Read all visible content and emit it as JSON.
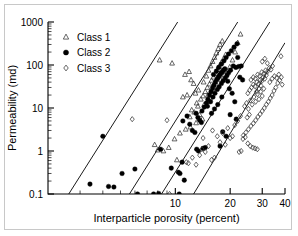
{
  "chart_data": {
    "type": "scatter",
    "title": "",
    "xlabel": "Interparticle porosity (percent)",
    "ylabel": "Permeability (md)",
    "xscale": "log",
    "yscale": "log",
    "xlim": [
      2,
      40
    ],
    "ylim": [
      0.1,
      1000
    ],
    "xticks": [
      10,
      20,
      30,
      40
    ],
    "xticklabels": [
      "10",
      "20",
      "30",
      "40"
    ],
    "yticks": [
      0.1,
      1,
      10,
      100,
      1000
    ],
    "yticklabels": [
      "0.1",
      "1",
      "10",
      "100",
      "1000"
    ],
    "grid": false,
    "legend_position": "upper-left",
    "legend": [
      {
        "label": "Class 1",
        "marker": "open-triangle",
        "color": "#333333"
      },
      {
        "label": "Class 2",
        "marker": "filled-circle",
        "color": "#000000"
      },
      {
        "label": "Class 3",
        "marker": "open-diamond",
        "color": "#333333"
      }
    ],
    "series": [
      {
        "name": "Class 1",
        "marker": "open-triangle",
        "points": [
          [
            8.2,
            130
          ],
          [
            9.6,
            110
          ],
          [
            11.3,
            60
          ],
          [
            11.9,
            70
          ],
          [
            12.2,
            45
          ],
          [
            12.6,
            37
          ],
          [
            11.0,
            18
          ],
          [
            11.6,
            20
          ],
          [
            12.9,
            22
          ],
          [
            13.4,
            26
          ],
          [
            13.1,
            13
          ],
          [
            12.3,
            9.0
          ],
          [
            13.6,
            7.0
          ],
          [
            14.1,
            5.5
          ],
          [
            13.0,
            4.5
          ],
          [
            12.1,
            3.6
          ],
          [
            11.4,
            3.2
          ],
          [
            10.6,
            2.6
          ],
          [
            9.9,
            1.9
          ],
          [
            9.2,
            1.2
          ],
          [
            8.6,
            1.0
          ],
          [
            8.0,
            1.05
          ],
          [
            7.7,
            1.4
          ],
          [
            10.2,
            0.62
          ],
          [
            14.3,
            40
          ],
          [
            14.8,
            55
          ],
          [
            15.2,
            75
          ],
          [
            15.6,
            95
          ],
          [
            16.0,
            120
          ],
          [
            16.4,
            150
          ],
          [
            16.8,
            190
          ],
          [
            17.2,
            240
          ],
          [
            17.6,
            300
          ],
          [
            18.1,
            360
          ],
          [
            15.0,
            30
          ],
          [
            15.4,
            36
          ],
          [
            15.8,
            44
          ],
          [
            16.2,
            52
          ],
          [
            16.6,
            62
          ],
          [
            17.0,
            78
          ],
          [
            17.4,
            92
          ],
          [
            17.9,
            115
          ],
          [
            18.4,
            140
          ],
          [
            18.9,
            175
          ],
          [
            14.6,
            24
          ],
          [
            15.1,
            20
          ],
          [
            15.5,
            17
          ],
          [
            14.9,
            14
          ],
          [
            14.4,
            12
          ],
          [
            16.1,
            28
          ],
          [
            16.9,
            34
          ],
          [
            17.8,
            46
          ],
          [
            18.6,
            58
          ],
          [
            19.3,
            70
          ],
          [
            19.9,
            90
          ],
          [
            20.6,
            130
          ],
          [
            21.3,
            200
          ],
          [
            22.0,
            330
          ],
          [
            22.8,
            520
          ],
          [
            13.8,
            16
          ],
          [
            14.2,
            19
          ],
          [
            13.3,
            11
          ],
          [
            12.7,
            8.0
          ],
          [
            12.0,
            6.2
          ]
        ]
      },
      {
        "name": "Class 2",
        "marker": "filled-circle",
        "points": [
          [
            3.4,
            0.17
          ],
          [
            4.3,
            0.15
          ],
          [
            4.6,
            0.145
          ],
          [
            4.0,
            2.2
          ],
          [
            5.1,
            0.3
          ],
          [
            6.0,
            0.38
          ],
          [
            6.2,
            0.1
          ],
          [
            7.6,
            0.1
          ],
          [
            8.1,
            0.103
          ],
          [
            8.3,
            1.1
          ],
          [
            9.5,
            0.4
          ],
          [
            10.4,
            0.32
          ],
          [
            10.6,
            0.3
          ],
          [
            10.5,
            0.1
          ],
          [
            11.2,
            0.21
          ],
          [
            10.9,
            0.55
          ],
          [
            11.0,
            5.0
          ],
          [
            11.6,
            6.5
          ],
          [
            12.0,
            4.2
          ],
          [
            12.4,
            3.0
          ],
          [
            12.8,
            2.7
          ],
          [
            13.0,
            7.5
          ],
          [
            13.3,
            6.0
          ],
          [
            13.6,
            5.2
          ],
          [
            13.9,
            4.6
          ],
          [
            13.1,
            1.1
          ],
          [
            13.4,
            1.0
          ],
          [
            14.2,
            1.15
          ],
          [
            14.6,
            1.2
          ],
          [
            14.0,
            8.5
          ],
          [
            14.4,
            10.5
          ],
          [
            14.8,
            13
          ],
          [
            15.1,
            16
          ],
          [
            15.4,
            20
          ],
          [
            15.7,
            24
          ],
          [
            16.0,
            29
          ],
          [
            16.3,
            34
          ],
          [
            16.6,
            40
          ],
          [
            16.9,
            46
          ],
          [
            17.2,
            52
          ],
          [
            17.5,
            58
          ],
          [
            17.8,
            64
          ],
          [
            18.1,
            70
          ],
          [
            18.4,
            76
          ],
          [
            18.7,
            82
          ],
          [
            15.0,
            11
          ],
          [
            15.6,
            14
          ],
          [
            16.1,
            18
          ],
          [
            16.5,
            22
          ],
          [
            17.0,
            27
          ],
          [
            17.4,
            31
          ],
          [
            17.9,
            37
          ],
          [
            18.3,
            43
          ],
          [
            18.8,
            50
          ],
          [
            19.2,
            57
          ],
          [
            19.6,
            66
          ],
          [
            20.1,
            76
          ],
          [
            16.2,
            60
          ],
          [
            16.8,
            72
          ],
          [
            17.3,
            88
          ],
          [
            17.9,
            105
          ],
          [
            18.5,
            125
          ],
          [
            19.0,
            150
          ],
          [
            19.6,
            180
          ],
          [
            20.3,
            215
          ],
          [
            21.0,
            260
          ],
          [
            21.8,
            310
          ],
          [
            20.8,
            95
          ],
          [
            21.5,
            88
          ],
          [
            22.3,
            92
          ],
          [
            23.0,
            95
          ],
          [
            22.0,
            150
          ],
          [
            19.4,
            42
          ],
          [
            18.0,
            18
          ],
          [
            17.1,
            12
          ],
          [
            16.4,
            9.5
          ],
          [
            15.8,
            7.5
          ],
          [
            19.8,
            28
          ],
          [
            20.5,
            22
          ],
          [
            21.2,
            14
          ],
          [
            20.0,
            7.0
          ],
          [
            21.6,
            5.5
          ],
          [
            18.2,
            2.8
          ],
          [
            19.0,
            2.2
          ],
          [
            17.6,
            1.3
          ],
          [
            22.6,
            52
          ],
          [
            23.4,
            45
          ]
        ]
      },
      {
        "name": "Class 3",
        "marker": "open-diamond",
        "points": [
          [
            5.8,
            5.5
          ],
          [
            9.0,
            5.2
          ],
          [
            9.3,
            0.1
          ],
          [
            11.5,
            0.55
          ],
          [
            11.8,
            0.52
          ],
          [
            12.4,
            0.7
          ],
          [
            13.0,
            0.48
          ],
          [
            13.6,
            0.8
          ],
          [
            14.2,
            2.0
          ],
          [
            14.0,
            1.1
          ],
          [
            14.6,
            0.95
          ],
          [
            15.2,
            1.3
          ],
          [
            15.8,
            0.62
          ],
          [
            16.4,
            0.7
          ],
          [
            16.0,
            3.0
          ],
          [
            17.0,
            2.2
          ],
          [
            17.6,
            1.6
          ],
          [
            18.2,
            2.6
          ],
          [
            18.8,
            1.4
          ],
          [
            19.4,
            3.4
          ],
          [
            20.0,
            2.0
          ],
          [
            20.6,
            2.2
          ],
          [
            21.2,
            4.0
          ],
          [
            22.0,
            5.0
          ],
          [
            22.8,
            6.5
          ],
          [
            23.5,
            1.9
          ],
          [
            24.2,
            2.1
          ],
          [
            25.0,
            1.5
          ],
          [
            25.8,
            1.3
          ],
          [
            26.6,
            1.2
          ],
          [
            27.4,
            1.15
          ],
          [
            28.2,
            1.1
          ],
          [
            24.0,
            11
          ],
          [
            24.6,
            13
          ],
          [
            25.2,
            9.5
          ],
          [
            25.8,
            15
          ],
          [
            26.4,
            12
          ],
          [
            27.0,
            18
          ],
          [
            27.6,
            14
          ],
          [
            28.2,
            21
          ],
          [
            28.8,
            16
          ],
          [
            29.4,
            24
          ],
          [
            30.0,
            19
          ],
          [
            30.6,
            28
          ],
          [
            25.0,
            22
          ],
          [
            25.6,
            26
          ],
          [
            26.2,
            30
          ],
          [
            26.8,
            35
          ],
          [
            27.4,
            32
          ],
          [
            28.0,
            40
          ],
          [
            28.6,
            36
          ],
          [
            29.2,
            45
          ],
          [
            29.8,
            42
          ],
          [
            30.4,
            52
          ],
          [
            31.0,
            48
          ],
          [
            31.6,
            58
          ],
          [
            26.0,
            45
          ],
          [
            26.8,
            52
          ],
          [
            27.5,
            48
          ],
          [
            28.3,
            60
          ],
          [
            29.0,
            55
          ],
          [
            29.8,
            68
          ],
          [
            30.5,
            62
          ],
          [
            31.3,
            75
          ],
          [
            32.0,
            70
          ],
          [
            32.8,
            85
          ],
          [
            33.5,
            78
          ],
          [
            34.2,
            95
          ],
          [
            30.0,
            120
          ],
          [
            31.0,
            140
          ],
          [
            32.0,
            110
          ],
          [
            38.0,
            160
          ],
          [
            38.6,
            35
          ],
          [
            38.2,
            52
          ],
          [
            37.4,
            44
          ],
          [
            36.5,
            38
          ],
          [
            35.6,
            30
          ],
          [
            34.8,
            25
          ],
          [
            34.0,
            20
          ],
          [
            33.2,
            17
          ],
          [
            32.4,
            14
          ],
          [
            31.6,
            12
          ],
          [
            30.8,
            10
          ],
          [
            30.0,
            8.5
          ],
          [
            29.2,
            7.2
          ],
          [
            28.4,
            6.2
          ],
          [
            27.6,
            5.2
          ],
          [
            26.8,
            4.4
          ],
          [
            26.0,
            3.8
          ],
          [
            25.2,
            3.2
          ],
          [
            24.4,
            2.7
          ],
          [
            23.6,
            2.3
          ],
          [
            33.0,
            40
          ],
          [
            34.0,
            48
          ],
          [
            35.0,
            55
          ],
          [
            36.0,
            50
          ],
          [
            37.0,
            60
          ],
          [
            29.5,
            33
          ],
          [
            28.8,
            28
          ],
          [
            27.9,
            24
          ],
          [
            24.8,
            6.0
          ],
          [
            25.5,
            7.0
          ],
          [
            23.0,
            1.0
          ],
          [
            22.4,
            0.95
          ]
        ]
      }
    ],
    "trendlines": [
      {
        "name": "line-1",
        "x1": 2.6,
        "y1": 0.1,
        "x2": 10.3,
        "y2": 1000
      },
      {
        "name": "line-2",
        "x1": 5.6,
        "y1": 0.1,
        "x2": 22.0,
        "y2": 1000
      },
      {
        "name": "line-3",
        "x1": 8.4,
        "y1": 0.1,
        "x2": 33.0,
        "y2": 1000
      },
      {
        "name": "line-4",
        "x1": 12.6,
        "y1": 0.1,
        "x2": 40.0,
        "y2": 330
      }
    ]
  }
}
